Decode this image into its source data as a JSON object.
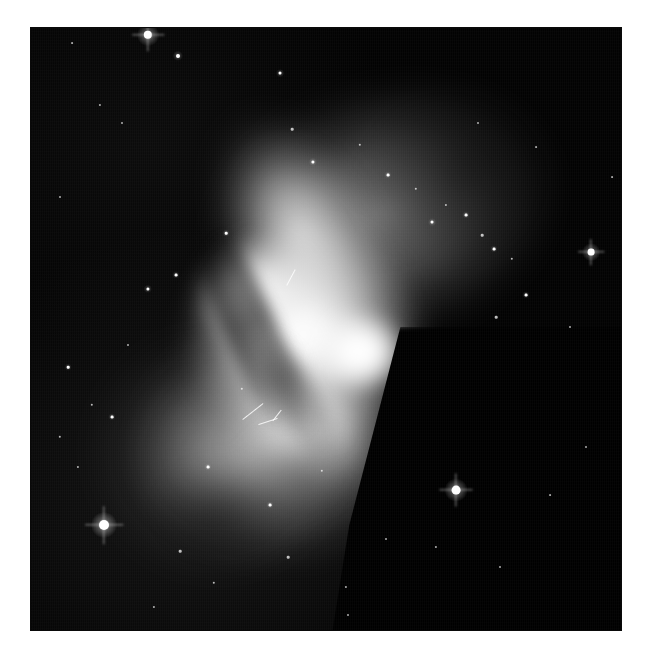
{
  "page": {
    "background_color": "#ffffff",
    "width": 648,
    "height": 660
  },
  "figure": {
    "caption": "",
    "panel": {
      "x": 30,
      "y": 27,
      "width": 592,
      "height": 604,
      "background_color": "#000000",
      "border_color": "#0a0a0a"
    }
  },
  "image_data": {
    "type": "astronomical-image",
    "modality": "grayscale-optical",
    "colormap": "grayscale",
    "object_morphology": "bipolar / butterfly nebula",
    "orientation_note": "NE lobe toward upper-right, SW lobe toward lower-left",
    "background_level": "#020202",
    "peak_level": "#ffffff",
    "components": [
      {
        "name": "northern-lobe",
        "label": "NE lobe",
        "center": [
          330,
          160
        ],
        "brightness": "medium",
        "description": "broad diffuse lobe with bright western rim and mottled dark eastern interior"
      },
      {
        "name": "bright-core",
        "label": "central waist",
        "center": [
          270,
          320
        ],
        "brightness": "saturated",
        "description": "brightest region; saturated white knot at the pinched waist"
      },
      {
        "name": "southern-lobe",
        "label": "SW lobe",
        "center": [
          250,
          450
        ],
        "brightness": "medium",
        "description": "lower lobe with sharp straight eastern boundary and fainter mottled SW halo"
      },
      {
        "name": "dust-lane",
        "label": "dust lane",
        "center": [
          225,
          305
        ],
        "brightness": "dark",
        "description": "diagonal absorption lane crossing the core from upper-left to lower-right"
      }
    ],
    "stars": [
      {
        "x": 118,
        "y": 8,
        "r": 4.2,
        "bright": true,
        "spikes": true
      },
      {
        "x": 148,
        "y": 29,
        "r": 2.0,
        "bright": true,
        "spikes": false
      },
      {
        "x": 42,
        "y": 16,
        "r": 0.9,
        "bright": false,
        "spikes": false
      },
      {
        "x": 70,
        "y": 78,
        "r": 1.1,
        "bright": false,
        "spikes": false
      },
      {
        "x": 250,
        "y": 46,
        "r": 1.5,
        "bright": true,
        "spikes": false
      },
      {
        "x": 262,
        "y": 102,
        "r": 1.3,
        "bright": false,
        "spikes": false
      },
      {
        "x": 283,
        "y": 135,
        "r": 1.6,
        "bright": true,
        "spikes": false
      },
      {
        "x": 330,
        "y": 118,
        "r": 1.2,
        "bright": false,
        "spikes": false
      },
      {
        "x": 358,
        "y": 148,
        "r": 1.4,
        "bright": true,
        "spikes": false
      },
      {
        "x": 386,
        "y": 162,
        "r": 1.2,
        "bright": false,
        "spikes": false
      },
      {
        "x": 402,
        "y": 195,
        "r": 1.5,
        "bright": true,
        "spikes": false
      },
      {
        "x": 416,
        "y": 178,
        "r": 1.1,
        "bright": false,
        "spikes": false
      },
      {
        "x": 436,
        "y": 188,
        "r": 1.4,
        "bright": true,
        "spikes": false
      },
      {
        "x": 452,
        "y": 208,
        "r": 1.3,
        "bright": false,
        "spikes": false
      },
      {
        "x": 464,
        "y": 222,
        "r": 1.4,
        "bright": true,
        "spikes": false
      },
      {
        "x": 482,
        "y": 232,
        "r": 1.2,
        "bright": false,
        "spikes": false
      },
      {
        "x": 496,
        "y": 268,
        "r": 1.4,
        "bright": true,
        "spikes": false
      },
      {
        "x": 466,
        "y": 290,
        "r": 1.3,
        "bright": false,
        "spikes": false
      },
      {
        "x": 561,
        "y": 225,
        "r": 3.4,
        "bright": true,
        "spikes": true
      },
      {
        "x": 600,
        "y": 252,
        "r": 1.2,
        "bright": false,
        "spikes": false
      },
      {
        "x": 540,
        "y": 300,
        "r": 1.0,
        "bright": false,
        "spikes": false
      },
      {
        "x": 92,
        "y": 96,
        "r": 1.0,
        "bright": false,
        "spikes": false
      },
      {
        "x": 30,
        "y": 170,
        "r": 1.0,
        "bright": false,
        "spikes": false
      },
      {
        "x": 118,
        "y": 262,
        "r": 1.6,
        "bright": true,
        "spikes": false
      },
      {
        "x": 98,
        "y": 318,
        "r": 1.0,
        "bright": false,
        "spikes": false
      },
      {
        "x": 38,
        "y": 340,
        "r": 1.3,
        "bright": true,
        "spikes": false
      },
      {
        "x": 62,
        "y": 378,
        "r": 1.2,
        "bright": false,
        "spikes": false
      },
      {
        "x": 82,
        "y": 390,
        "r": 1.4,
        "bright": true,
        "spikes": false
      },
      {
        "x": 30,
        "y": 410,
        "r": 1.2,
        "bright": false,
        "spikes": false
      },
      {
        "x": 48,
        "y": 440,
        "r": 1.1,
        "bright": false,
        "spikes": false
      },
      {
        "x": 146,
        "y": 248,
        "r": 1.4,
        "bright": true,
        "spikes": false
      },
      {
        "x": 196,
        "y": 206,
        "r": 1.3,
        "bright": true,
        "spikes": false
      },
      {
        "x": 178,
        "y": 440,
        "r": 1.4,
        "bright": true,
        "spikes": false
      },
      {
        "x": 212,
        "y": 362,
        "r": 1.2,
        "bright": false,
        "spikes": false
      },
      {
        "x": 240,
        "y": 478,
        "r": 1.4,
        "bright": true,
        "spikes": false
      },
      {
        "x": 292,
        "y": 444,
        "r": 1.2,
        "bright": false,
        "spikes": false
      },
      {
        "x": 258,
        "y": 530,
        "r": 1.3,
        "bright": false,
        "spikes": false
      },
      {
        "x": 74,
        "y": 498,
        "r": 5.0,
        "bright": true,
        "spikes": true
      },
      {
        "x": 426,
        "y": 463,
        "r": 4.4,
        "bright": true,
        "spikes": true
      },
      {
        "x": 150,
        "y": 524,
        "r": 1.3,
        "bright": false,
        "spikes": false
      },
      {
        "x": 184,
        "y": 556,
        "r": 1.2,
        "bright": false,
        "spikes": false
      },
      {
        "x": 316,
        "y": 560,
        "r": 1.1,
        "bright": false,
        "spikes": false
      },
      {
        "x": 356,
        "y": 512,
        "r": 1.0,
        "bright": false,
        "spikes": false
      },
      {
        "x": 406,
        "y": 520,
        "r": 1.1,
        "bright": false,
        "spikes": false
      },
      {
        "x": 470,
        "y": 540,
        "r": 1.0,
        "bright": false,
        "spikes": false
      },
      {
        "x": 318,
        "y": 588,
        "r": 1.0,
        "bright": false,
        "spikes": false
      },
      {
        "x": 124,
        "y": 580,
        "r": 1.1,
        "bright": false,
        "spikes": false
      },
      {
        "x": 556,
        "y": 420,
        "r": 1.0,
        "bright": false,
        "spikes": false
      },
      {
        "x": 520,
        "y": 468,
        "r": 0.9,
        "bright": false,
        "spikes": false
      },
      {
        "x": 582,
        "y": 150,
        "r": 0.9,
        "bright": false,
        "spikes": false
      },
      {
        "x": 448,
        "y": 96,
        "r": 1.0,
        "bright": false,
        "spikes": false
      },
      {
        "x": 506,
        "y": 120,
        "r": 0.9,
        "bright": false,
        "spikes": false
      }
    ],
    "filaments": [
      {
        "x": 210,
        "y": 384,
        "length": 26,
        "angle": -38,
        "thickness": 1.4
      },
      {
        "x": 228,
        "y": 394,
        "length": 20,
        "angle": -18,
        "thickness": 1.2
      },
      {
        "x": 240,
        "y": 388,
        "length": 14,
        "angle": -52,
        "thickness": 1.0
      },
      {
        "x": 252,
        "y": 250,
        "length": 18,
        "angle": -62,
        "thickness": 1.1
      }
    ]
  }
}
